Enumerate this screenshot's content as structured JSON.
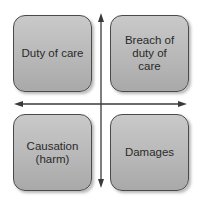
{
  "diagram": {
    "type": "quadrant",
    "quadrants": [
      {
        "position": "top-left",
        "label": "Duty of care"
      },
      {
        "position": "top-right",
        "label": "Breach of duty of care"
      },
      {
        "position": "bottom-left",
        "label": "Causation (harm)"
      },
      {
        "position": "bottom-right",
        "label": "Damages"
      }
    ],
    "axes": {
      "vertical": "double-headed arrow",
      "horizontal": "double-headed arrow"
    },
    "colors": {
      "box_fill": "#bdbdbd",
      "box_border": "#4a4a4a",
      "arrow": "#3a3a3a",
      "text": "#2a2a2a"
    }
  }
}
